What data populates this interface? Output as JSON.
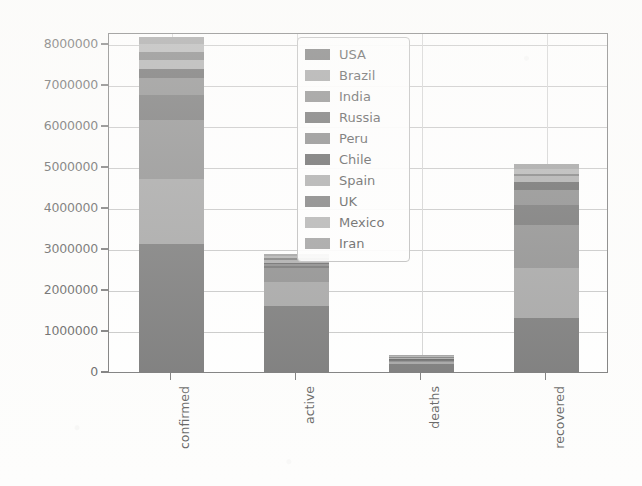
{
  "chart_data": {
    "type": "bar",
    "subtype": "stacked-bar",
    "title": "",
    "xlabel": "",
    "ylabel": "",
    "categories": [
      "confirmed",
      "active",
      "deaths",
      "recovered"
    ],
    "ylim": [
      0,
      8000000
    ],
    "ytick_labels": [
      "8000000",
      "7000000",
      "6000000",
      "5000000",
      "4000000",
      "3000000",
      "2000000",
      "1000000",
      "0"
    ],
    "ytick_values": [
      8000000,
      7000000,
      6000000,
      5000000,
      4000000,
      3000000,
      2000000,
      1000000,
      0
    ],
    "grid": true,
    "legend_position": "upper center",
    "legend_entries": [
      "USA",
      "Brazil",
      "India",
      "Russia",
      "Peru",
      "Chile",
      "Spain",
      "UK",
      "Mexico",
      "Iran"
    ],
    "series": [
      {
        "name": "USA",
        "color": "#555555",
        "values": [
          3130000,
          1620000,
          203000,
          1320000
        ]
      },
      {
        "name": "Brazil",
        "color": "#8c8c8c",
        "values": [
          1590000,
          600000,
          65000,
          1230000
        ]
      },
      {
        "name": "India",
        "color": "#6e6e6e",
        "values": [
          1440000,
          320000,
          33000,
          1040000
        ]
      },
      {
        "name": "Russia",
        "color": "#4c4c4c",
        "values": [
          615000,
          70000,
          10000,
          510000
        ]
      },
      {
        "name": "Peru",
        "color": "#6a6a6a",
        "values": [
          400000,
          35000,
          12000,
          345000
        ]
      },
      {
        "name": "Chile",
        "color": "#3f3f3f",
        "values": [
          240000,
          22000,
          7500,
          205000
        ]
      },
      {
        "name": "Spain",
        "color": "#969696",
        "values": [
          215000,
          70000,
          30000,
          140000
        ]
      },
      {
        "name": "UK",
        "color": "#5e5e5e",
        "values": [
          200000,
          60000,
          25000,
          55000
        ]
      },
      {
        "name": "Mexico",
        "color": "#a0a0a0",
        "values": [
          190000,
          50000,
          23000,
          130000
        ]
      },
      {
        "name": "Iran",
        "color": "#888888",
        "values": [
          170000,
          35000,
          9500,
          125000
        ]
      }
    ],
    "totals": [
      7950000,
      2780000,
      370000,
      4330000
    ]
  },
  "axes": {
    "y_ticks": [
      {
        "label": "8000000",
        "value": 8000000
      },
      {
        "label": "7000000",
        "value": 7000000
      },
      {
        "label": "6000000",
        "value": 6000000
      },
      {
        "label": "5000000",
        "value": 5000000
      },
      {
        "label": "4000000",
        "value": 4000000
      },
      {
        "label": "3000000",
        "value": 3000000
      },
      {
        "label": "2000000",
        "value": 2000000
      },
      {
        "label": "1000000",
        "value": 1000000
      },
      {
        "label": "0",
        "value": 0
      }
    ],
    "x_ticks": [
      {
        "label": "confirmed"
      },
      {
        "label": "active"
      },
      {
        "label": "deaths"
      },
      {
        "label": "recovered"
      }
    ]
  },
  "legend": {
    "items": [
      {
        "label": "USA",
        "color": "#555555"
      },
      {
        "label": "Brazil",
        "color": "#8c8c8c"
      },
      {
        "label": "India",
        "color": "#6e6e6e"
      },
      {
        "label": "Russia",
        "color": "#4c4c4c"
      },
      {
        "label": "Peru",
        "color": "#6a6a6a"
      },
      {
        "label": "Chile",
        "color": "#3f3f3f"
      },
      {
        "label": "Spain",
        "color": "#969696"
      },
      {
        "label": "UK",
        "color": "#5e5e5e"
      },
      {
        "label": "Mexico",
        "color": "#a0a0a0"
      },
      {
        "label": "Iran",
        "color": "#888888"
      }
    ]
  }
}
